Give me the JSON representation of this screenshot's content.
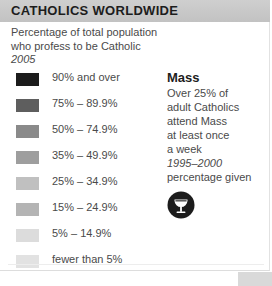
{
  "header": {
    "title": "CATHOLICS WORLDWIDE",
    "bar_color": "#c6c6c6"
  },
  "subtitle": {
    "line1": "Percentage of total population",
    "line2": "who profess to be Catholic",
    "year": "2005"
  },
  "chart_data": {
    "type": "table",
    "title": "CATHOLICS WORLDWIDE",
    "subtitle": "Percentage of total population who profess to be Catholic",
    "year": "2005",
    "legend_position": "left",
    "categories": [
      "90% and over",
      "75% – 89.9%",
      "50% – 74.9%",
      "35% – 49.9%",
      "25% – 34.9%",
      "15% – 24.9%",
      "5% – 14.9%",
      "fewer than 5%"
    ],
    "colors": [
      "#1c1c1c",
      "#5e5e5e",
      "#8a8a8a",
      "#9e9e9e",
      "#c0c0c0",
      "#b4b4b4",
      "#dcdcdc",
      "#e2e2e2"
    ],
    "bins": [
      {
        "label": "90% and over",
        "color": "#1c1c1c",
        "min": 90,
        "max": 100
      },
      {
        "label": "75% – 89.9%",
        "color": "#5e5e5e",
        "min": 75,
        "max": 89.9
      },
      {
        "label": "50% – 74.9%",
        "color": "#8a8a8a",
        "min": 50,
        "max": 74.9
      },
      {
        "label": "35% – 49.9%",
        "color": "#9e9e9e",
        "min": 35,
        "max": 49.9
      },
      {
        "label": "25% – 34.9%",
        "color": "#c0c0c0",
        "min": 25,
        "max": 34.9
      },
      {
        "label": "15% – 24.9%",
        "color": "#b4b4b4",
        "min": 15,
        "max": 24.9
      },
      {
        "label": "5% – 14.9%",
        "color": "#dcdcdc",
        "min": 5,
        "max": 14.9
      },
      {
        "label": "fewer than 5%",
        "color": "#e2e2e2",
        "min": 0,
        "max": 4.9
      }
    ]
  },
  "legend": {
    "items": [
      {
        "label": "90% and over",
        "color": "#1c1c1c"
      },
      {
        "label": "75% – 89.9%",
        "color": "#5e5e5e"
      },
      {
        "label": "50% – 74.9%",
        "color": "#8a8a8a"
      },
      {
        "label": "35% – 49.9%",
        "color": "#9e9e9e"
      },
      {
        "label": "25% – 34.9%",
        "color": "#c0c0c0"
      },
      {
        "label": "15% – 24.9%",
        "color": "#b4b4b4"
      },
      {
        "label": "5% – 14.9%",
        "color": "#dcdcdc"
      },
      {
        "label": "fewer than 5%",
        "color": "#e2e2e2"
      }
    ]
  },
  "mass": {
    "title": "Mass",
    "line1": "Over 25% of",
    "line2": "adult Catholics",
    "line3": "attend Mass",
    "line4": "at least once",
    "line5": "a week",
    "years": "1995–2000",
    "note": "percentage given",
    "icon": "chalice-icon"
  }
}
